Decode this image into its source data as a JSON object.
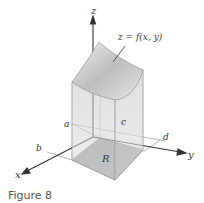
{
  "figure": {
    "caption": "Figure 8",
    "surface_label": "z = f(x, y)",
    "axes": {
      "x": "x",
      "y": "y",
      "z": "z"
    },
    "bounds": {
      "a": "a",
      "b": "b",
      "c": "c",
      "d": "d"
    },
    "region_label": "R"
  },
  "colors": {
    "axis": "#333333",
    "surface": "#c9c9c9",
    "box_side": "#e3e3e3",
    "region": "#8f8f8f"
  }
}
